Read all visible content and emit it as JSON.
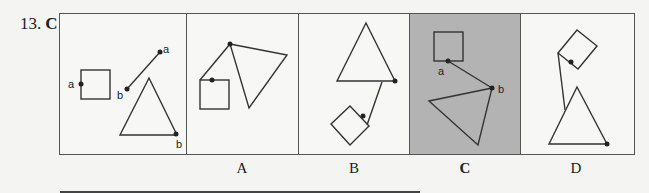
{
  "question": {
    "number": "13.",
    "answer": "C"
  },
  "stem_panel": {
    "labels": [
      "a",
      "a",
      "b",
      "b"
    ]
  },
  "options": [
    {
      "label": "A",
      "selected": false
    },
    {
      "label": "B",
      "selected": false
    },
    {
      "label": "C",
      "selected": true
    },
    {
      "label": "D",
      "selected": false
    }
  ],
  "option_c_labels": {
    "point_a": "a",
    "point_b": "b"
  },
  "colors": {
    "selected_background": "#b3b3b3",
    "stroke": "#333333",
    "page_background": "#f4f4f2"
  }
}
